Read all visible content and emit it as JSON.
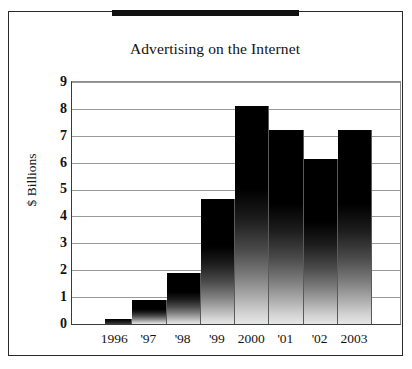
{
  "figure": {
    "title": "Advertising on the Internet",
    "top_rule": "black-rule",
    "frame_color": "#2a2a2a"
  },
  "chart_data": {
    "type": "bar",
    "title": "Advertising on the Internet",
    "xlabel": "",
    "ylabel": "$ Billions",
    "categories": [
      "1996",
      "'97",
      "'98",
      "'99",
      "2000",
      "'01",
      "'02",
      "2003"
    ],
    "values": [
      0.2,
      0.9,
      1.9,
      4.65,
      8.1,
      7.2,
      6.15,
      7.2
    ],
    "ylim": [
      0,
      9
    ],
    "yticks": [
      0,
      1,
      2,
      3,
      4,
      5,
      6,
      7,
      8,
      9
    ],
    "ytick_labels": [
      "0",
      "1",
      "2",
      "3",
      "4",
      "5",
      "6",
      "7",
      "8",
      "9"
    ],
    "grid": true,
    "grid_axis": "y",
    "legend": false,
    "bar_fill": "black-to-light-vertical-gradient",
    "bar_color_top": "#000000",
    "bar_color_bottom": "#e6e6e6"
  }
}
